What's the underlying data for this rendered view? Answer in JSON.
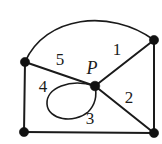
{
  "figure": {
    "background_color": "#ffffff",
    "stroke_color": "#1a1a1a",
    "vertex_color": "#111111",
    "width": 162,
    "height": 144
  },
  "vertices": [
    {
      "id": "left",
      "name": "vertex-left",
      "x": 25,
      "y": 62,
      "r": 4.6,
      "label": ""
    },
    {
      "id": "top_right",
      "name": "vertex-top-right",
      "x": 154,
      "y": 40,
      "r": 4.6,
      "label": ""
    },
    {
      "id": "bottom_left",
      "name": "vertex-bottom-left",
      "x": 24,
      "y": 132,
      "r": 4.6,
      "label": ""
    },
    {
      "id": "bottom_right",
      "name": "vertex-bottom-right",
      "x": 154,
      "y": 133,
      "r": 4.6,
      "label": ""
    },
    {
      "id": "center",
      "name": "vertex-center-p",
      "x": 95,
      "y": 86,
      "r": 4.8,
      "label": "P"
    }
  ],
  "edges": [
    {
      "id": "arc_left_topright",
      "name": "edge-arc-left-to-top-right",
      "kind": "arc",
      "path": "M 25 62 C 45 16, 110 8, 154 40"
    },
    {
      "id": "left_center",
      "name": "edge-left-to-center",
      "kind": "line",
      "path": "M 25 62 L 95 86"
    },
    {
      "id": "center_topright",
      "name": "edge-center-to-top-right",
      "kind": "line",
      "path": "M 95 86 L 154 40"
    },
    {
      "id": "center_bottomright",
      "name": "edge-center-to-bottom-right",
      "kind": "line",
      "path": "M 95 86 L 154 133"
    },
    {
      "id": "left_bottomleft",
      "name": "edge-left-to-bottom-left",
      "kind": "line",
      "path": "M 25 62 L 24 132"
    },
    {
      "id": "bottom_side",
      "name": "edge-bottom-left-to-bottom-right",
      "kind": "line",
      "path": "M 24 132 L 154 133"
    },
    {
      "id": "right_side",
      "name": "edge-top-right-to-bottom-right",
      "kind": "line",
      "path": "M 154 40 L 154 133"
    },
    {
      "id": "loop_at_p",
      "name": "edge-loop-at-p",
      "kind": "loop",
      "path": "M 95 86 C 70 78, 46 88, 47 104 C 48 120, 74 124, 88 112 C 95 105, 97 95, 95 86"
    }
  ],
  "region_labels": [
    {
      "id": "r1",
      "name": "region-label-1",
      "text": "1",
      "x": 117,
      "y": 49
    },
    {
      "id": "r2",
      "name": "region-label-2",
      "text": "2",
      "x": 129,
      "y": 97
    },
    {
      "id": "r3",
      "name": "region-label-3",
      "text": "3",
      "x": 90,
      "y": 118
    },
    {
      "id": "r4",
      "name": "region-label-4",
      "text": "4",
      "x": 43,
      "y": 86
    },
    {
      "id": "r5",
      "name": "region-label-5",
      "text": "5",
      "x": 60,
      "y": 59
    }
  ],
  "point_labels": [
    {
      "id": "p",
      "name": "point-label-p",
      "text": "P",
      "x": 92,
      "y": 68
    }
  ]
}
